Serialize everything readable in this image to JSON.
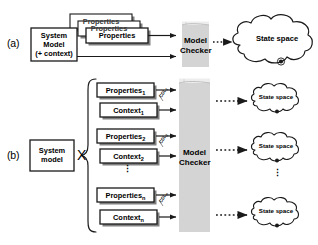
{
  "figure": {
    "panels": [
      {
        "id": "a",
        "letter": "(a)",
        "model_box": {
          "line1": "System",
          "line2": "Model",
          "line3": "(+ context)"
        },
        "properties_stack": {
          "label": "Properties",
          "count": 3
        },
        "model_checker": {
          "line1": "Model",
          "line2": "Checker"
        },
        "state_space": {
          "label": "State space"
        }
      },
      {
        "id": "b",
        "letter": "(b)",
        "model_box": {
          "line1": "System",
          "line2": "model"
        },
        "product_operator": "X",
        "pairs": [
          {
            "properties": "Properties",
            "properties_sub": "1",
            "context": "Context",
            "context_sub": "1",
            "cdl": "CDL",
            "cdl_sub": "1"
          },
          {
            "properties": "Properties",
            "properties_sub": "2",
            "context": "Context",
            "context_sub": "2",
            "cdl": "CDL",
            "cdl_sub": "2"
          },
          {
            "properties": "Properties",
            "properties_sub": "n",
            "context": "Context",
            "context_sub": "n",
            "cdl": "CDL",
            "cdl_sub": "n"
          }
        ],
        "ellipsis_between_pairs": "⋮",
        "model_checker": {
          "line1": "Model",
          "line2": "Checker"
        },
        "state_spaces": [
          {
            "label": "State space"
          },
          {
            "label": "State space"
          },
          {
            "label": "State space"
          }
        ],
        "state_space_ellipsis": "⋮"
      }
    ],
    "colors": {
      "model_checker_fill": "#d4d4d4",
      "model_checker_top_fill": "#ededed",
      "stroke": "#1a1a1a",
      "background": "#ffffff",
      "shadow": "#777777",
      "marker_dot": "#1a1a1a"
    }
  }
}
